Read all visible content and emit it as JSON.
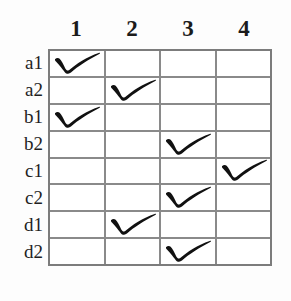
{
  "figure": {
    "name": "checklist-grid",
    "line_color": "#8a8a8a",
    "ink_color": "#111111",
    "background": "#fdfdfd"
  },
  "columns": [
    {
      "label": "1"
    },
    {
      "label": "2"
    },
    {
      "label": "3"
    },
    {
      "label": "4"
    }
  ],
  "rows": [
    {
      "label": "a1",
      "checked_column": 1
    },
    {
      "label": "a2",
      "checked_column": 2
    },
    {
      "label": "b1",
      "checked_column": 1
    },
    {
      "label": "b2",
      "checked_column": 3
    },
    {
      "label": "c1",
      "checked_column": 4
    },
    {
      "label": "c2",
      "checked_column": 3
    },
    {
      "label": "d1",
      "checked_column": 2
    },
    {
      "label": "d2",
      "checked_column": 3
    }
  ],
  "marks": {
    "glyph": "check-mark"
  }
}
